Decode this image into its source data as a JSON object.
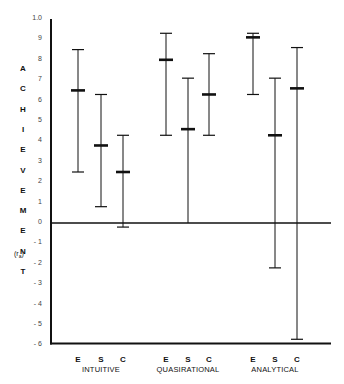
{
  "chart_data": {
    "type": "errorbar",
    "title": "",
    "ylabel": "ACHIEVEMENT (r_a)",
    "ylabel_letters": [
      "A",
      "C",
      "H",
      "I",
      "E",
      "V",
      "E",
      "M",
      "E",
      "N",
      "T"
    ],
    "ylabel_sub": "(r a)",
    "ylim": [
      -0.6,
      1.0
    ],
    "yticks": [
      1.0,
      0.9,
      0.8,
      0.7,
      0.6,
      0.5,
      0.4,
      0.3,
      0.2,
      0.1,
      0,
      -0.1,
      -0.2,
      -0.3,
      -0.4,
      -0.5,
      -0.6
    ],
    "ytick_labels": [
      "1.0",
      "9",
      "8",
      "7",
      "6",
      "5",
      "4",
      "3",
      "2",
      "1",
      "0",
      "- 1",
      "- 2",
      "- 3",
      "- 4",
      "- 5",
      "- 6"
    ],
    "groups": [
      "INTUITIVE",
      "QUASIRATIONAL",
      "ANALYTICAL"
    ],
    "subcategories": [
      "E",
      "S",
      "C"
    ],
    "series": [
      {
        "group": "INTUITIVE",
        "label": "E",
        "mean": 0.65,
        "high": 0.85,
        "low": 0.25
      },
      {
        "group": "INTUITIVE",
        "label": "S",
        "mean": 0.38,
        "high": 0.63,
        "low": 0.08
      },
      {
        "group": "INTUITIVE",
        "label": "C",
        "mean": 0.25,
        "high": 0.43,
        "low": -0.02
      },
      {
        "group": "QUASIRATIONAL",
        "label": "E",
        "mean": 0.8,
        "high": 0.93,
        "low": 0.43
      },
      {
        "group": "QUASIRATIONAL",
        "label": "S",
        "mean": 0.46,
        "high": 0.71,
        "low": 0.0
      },
      {
        "group": "QUASIRATIONAL",
        "label": "C",
        "mean": 0.63,
        "high": 0.83,
        "low": 0.43
      },
      {
        "group": "ANALYTICAL",
        "label": "E",
        "mean": 0.91,
        "high": 0.93,
        "low": 0.63
      },
      {
        "group": "ANALYTICAL",
        "label": "S",
        "mean": 0.43,
        "high": 0.71,
        "low": -0.22
      },
      {
        "group": "ANALYTICAL",
        "label": "C",
        "mean": 0.66,
        "high": 0.86,
        "low": -0.57
      }
    ],
    "grid": false,
    "reference_line": 0
  }
}
